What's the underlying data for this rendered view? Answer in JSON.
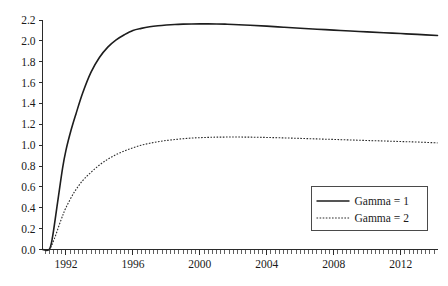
{
  "chart_data": {
    "type": "line",
    "title": "",
    "xlabel": "",
    "ylabel": "",
    "xlim": [
      1990.6,
      2014.2
    ],
    "ylim": [
      0.0,
      2.2
    ],
    "grid": false,
    "legend_position": "bottom-right",
    "x_tick_labels": [
      "1992",
      "1996",
      "2000",
      "2004",
      "2008",
      "2012"
    ],
    "x_tick_values": [
      1992,
      1996,
      2000,
      2004,
      2008,
      2012
    ],
    "x_minor_tick_interval": 0.25,
    "y_tick_labels": [
      "0.0",
      "0.2",
      "0.4",
      "0.6",
      "0.8",
      "1.0",
      "1.2",
      "1.4",
      "1.6",
      "1.8",
      "2.0",
      "2.2"
    ],
    "y_tick_values": [
      0.0,
      0.2,
      0.4,
      0.6,
      0.8,
      1.0,
      1.2,
      1.4,
      1.6,
      1.8,
      2.0,
      2.2
    ],
    "series": [
      {
        "name": "Gamma = 1",
        "style": "solid",
        "color": "#1d1d1d",
        "x": [
          1990.6,
          1991.0,
          1991.2,
          1991.5,
          1991.8,
          1992.0,
          1992.3,
          1992.6,
          1993.0,
          1993.5,
          1994.0,
          1994.5,
          1995.0,
          1995.5,
          1996.0,
          1996.5,
          1997.0,
          1997.5,
          1998.0,
          1998.5,
          1999.0,
          1999.5,
          2000.0,
          2000.5,
          2001.0,
          2001.5,
          2002.0,
          2003.0,
          2004.0,
          2005.0,
          2006.0,
          2007.0,
          2008.0,
          2009.0,
          2010.0,
          2011.0,
          2012.0,
          2013.0,
          2014.2
        ],
        "y": [
          0.0,
          0.0,
          0.12,
          0.45,
          0.78,
          0.95,
          1.14,
          1.3,
          1.5,
          1.7,
          1.84,
          1.94,
          2.01,
          2.06,
          2.1,
          2.12,
          2.135,
          2.145,
          2.152,
          2.157,
          2.16,
          2.162,
          2.163,
          2.163,
          2.162,
          2.16,
          2.157,
          2.15,
          2.141,
          2.131,
          2.121,
          2.112,
          2.103,
          2.094,
          2.086,
          2.078,
          2.07,
          2.062,
          2.052
        ]
      },
      {
        "name": "Gamma = 2",
        "style": "dashed",
        "color": "#2a2a2a",
        "x": [
          1990.6,
          1991.0,
          1991.3,
          1991.7,
          1992.0,
          1992.5,
          1993.0,
          1993.5,
          1994.0,
          1994.5,
          1995.0,
          1995.5,
          1996.0,
          1996.5,
          1997.0,
          1997.5,
          1998.0,
          1998.5,
          1999.0,
          1999.5,
          2000.0,
          2000.5,
          2001.0,
          2002.0,
          2003.0,
          2004.0,
          2005.0,
          2006.0,
          2007.0,
          2008.0,
          2009.0,
          2010.0,
          2011.0,
          2012.0,
          2013.0,
          2014.2
        ],
        "y": [
          0.0,
          0.0,
          0.1,
          0.28,
          0.4,
          0.55,
          0.66,
          0.74,
          0.81,
          0.865,
          0.91,
          0.945,
          0.975,
          1.0,
          1.018,
          1.033,
          1.045,
          1.054,
          1.062,
          1.068,
          1.072,
          1.075,
          1.077,
          1.078,
          1.077,
          1.074,
          1.07,
          1.065,
          1.06,
          1.055,
          1.05,
          1.045,
          1.04,
          1.035,
          1.03,
          1.022
        ]
      }
    ]
  },
  "legend": {
    "entries": [
      {
        "label": "Gamma = 1"
      },
      {
        "label": "Gamma = 2"
      }
    ]
  }
}
